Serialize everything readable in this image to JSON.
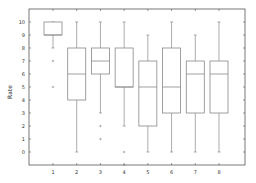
{
  "chart_data": {
    "type": "boxplot",
    "title": "",
    "xlabel": "",
    "ylabel": "Rate",
    "ylim": [
      -1,
      11
    ],
    "yticks": [
      0,
      1,
      2,
      3,
      4,
      5,
      6,
      7,
      8,
      9,
      10
    ],
    "categories": [
      "1",
      "2",
      "3",
      "4",
      "5",
      "6",
      "7",
      "8"
    ],
    "grid": false,
    "boxes": [
      {
        "category": "1",
        "whisker_low": 8,
        "q1": 9,
        "median": 9,
        "q3": 10,
        "whisker_high": 10,
        "outliers": [
          7,
          5
        ]
      },
      {
        "category": "2",
        "whisker_low": 0,
        "q1": 4,
        "median": 6,
        "q3": 8,
        "whisker_high": 10,
        "outliers": []
      },
      {
        "category": "3",
        "whisker_low": 3,
        "q1": 6,
        "median": 7,
        "q3": 8,
        "whisker_high": 10,
        "outliers": [
          2,
          1
        ]
      },
      {
        "category": "4",
        "whisker_low": 2,
        "q1": 5,
        "median": 5,
        "q3": 8,
        "whisker_high": 10,
        "outliers": [
          0,
          -1
        ]
      },
      {
        "category": "5",
        "whisker_low": 0,
        "q1": 2,
        "median": 5,
        "q3": 7,
        "whisker_high": 9,
        "outliers": []
      },
      {
        "category": "6",
        "whisker_low": 0,
        "q1": 3,
        "median": 5,
        "q3": 8,
        "whisker_high": 10,
        "outliers": []
      },
      {
        "category": "7",
        "whisker_low": 0,
        "q1": 3,
        "median": 6,
        "q3": 7,
        "whisker_high": 9,
        "outliers": []
      },
      {
        "category": "8",
        "whisker_low": 0,
        "q1": 3,
        "median": 6,
        "q3": 7,
        "whisker_high": 10,
        "outliers": []
      }
    ],
    "colors": {
      "box": "#888888",
      "frame": "#555555",
      "outlier": "#888888"
    }
  }
}
